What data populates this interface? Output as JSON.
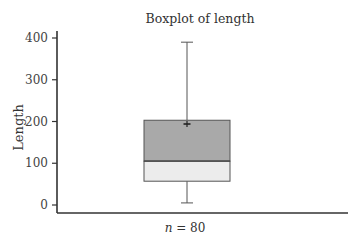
{
  "chart_data": {
    "type": "boxplot",
    "title": "Boxplot of length",
    "xlabel": "",
    "ylabel": "Length",
    "ylim": [
      0,
      400
    ],
    "yticks": [
      0,
      100,
      200,
      300,
      400
    ],
    "n_label_prefix": "n",
    "n_label_value": "= 80",
    "n": 80,
    "series": [
      {
        "name": "length",
        "whisker_low": 5,
        "q1": 57,
        "median": 105,
        "q3": 203,
        "whisker_high": 390,
        "mean": 194
      }
    ],
    "colors": {
      "upper_box": "#a9a9a9",
      "lower_box": "#ececec",
      "lines": "#555555",
      "axis": "#333333"
    },
    "grid": false
  },
  "labels": {
    "title": "Boxplot of length",
    "ylabel": "Length",
    "n_italic": "n",
    "n_rest": " = 80",
    "ticks": [
      "0",
      "100",
      "200",
      "300",
      "400"
    ]
  }
}
